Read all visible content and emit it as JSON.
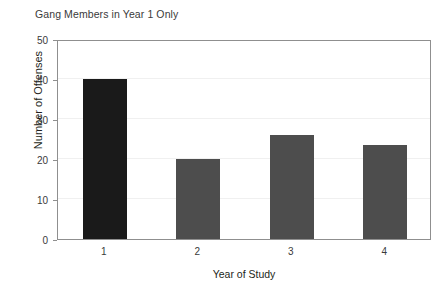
{
  "chart_data": {
    "type": "bar",
    "title": "Gang Members in Year 1 Only",
    "xlabel": "Year of Study",
    "ylabel": "Number of Offenses",
    "categories": [
      "1",
      "2",
      "3",
      "4"
    ],
    "values": [
      40,
      20,
      26,
      23.5
    ],
    "series": [
      {
        "name": "Number of Offenses",
        "values": [
          40,
          20,
          26,
          23.5
        ]
      }
    ],
    "bar_colors": [
      "#1a1a1a",
      "#4d4d4d",
      "#4d4d4d",
      "#4d4d4d"
    ],
    "ylim": [
      0,
      50
    ],
    "y_ticks": [
      0,
      10,
      20,
      30,
      40,
      50
    ],
    "y_tick_labels": [
      "0",
      "10",
      "20",
      "30",
      "40",
      "50"
    ],
    "x_tick_labels": [
      "1",
      "2",
      "3",
      "4"
    ],
    "grid": true,
    "grid_color": "#f0f0f0",
    "legend": null,
    "legend_position": "none",
    "frame_color": "#8f8f8f",
    "background": "#ffffff",
    "text_color": "#231f20"
  }
}
